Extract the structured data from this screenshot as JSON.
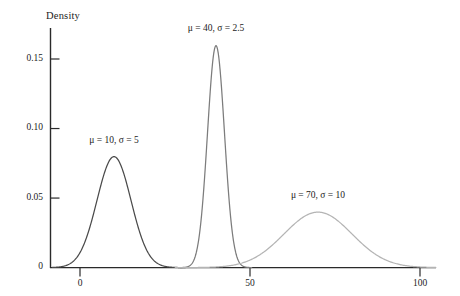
{
  "chart_data": {
    "type": "line",
    "title": "",
    "subtitle": "",
    "xlabel": "",
    "ylabel": "Density",
    "xlim": [
      -15,
      105
    ],
    "ylim": [
      0,
      0.171
    ],
    "grid": false,
    "legend": "none (inline curve annotations)",
    "x_ticks": [
      "0",
      "50",
      "100"
    ],
    "x_tick_values": [
      0,
      50,
      100
    ],
    "y_ticks": [
      "0",
      "0.05",
      "0.10",
      "0.15"
    ],
    "y_tick_values": [
      0,
      0.05,
      0.1,
      0.15
    ],
    "distribution": "normal",
    "series": [
      {
        "name": "μ = 10, σ = 5",
        "mu": 10,
        "sigma": 5,
        "peak_density": 0.0798,
        "color": "#4a4a4a",
        "label_x": 10,
        "label_y": 0.0905
      },
      {
        "name": "μ = 40, σ = 2.5",
        "mu": 40,
        "sigma": 2.5,
        "peak_density": 0.1596,
        "color": "#7c7c7c",
        "label_x": 40,
        "label_y": 0.1705
      },
      {
        "name": "μ = 70, σ = 10",
        "mu": 70,
        "sigma": 10,
        "peak_density": 0.0399,
        "color": "#b4b4b4",
        "label_x": 70,
        "label_y": 0.0505
      }
    ]
  },
  "axes": {
    "y_axis_title": "Density",
    "x_tick_labels": [
      "0",
      "50",
      "100"
    ],
    "y_tick_labels": [
      "0",
      "0.05",
      "0.10",
      "0.15"
    ]
  },
  "annotations": {
    "curve1": "μ = 10, σ = 5",
    "curve2": "μ = 40, σ = 2.5",
    "curve3": "μ = 70, σ = 10"
  },
  "colors": {
    "axis": "#2a2a2a",
    "curve1": "#4a4a4a",
    "curve2": "#7c7c7c",
    "curve3": "#b4b4b4",
    "background": "#ffffff",
    "text": "#1c1c1c"
  }
}
